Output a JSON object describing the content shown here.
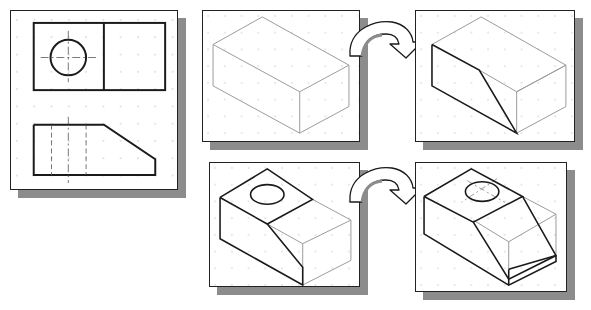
{
  "diagram": {
    "panels": [
      {
        "id": "orthographic-views",
        "label": "Top and front orthographic views with hole and angled cut"
      },
      {
        "id": "iso-base-block",
        "label": "Isometric base rectangular block"
      },
      {
        "id": "iso-angled-cut",
        "label": "Isometric block with angled cut on front face"
      },
      {
        "id": "iso-cut-with-hole",
        "label": "Isometric block with cut and circular hole on top"
      },
      {
        "id": "iso-final-part",
        "label": "Isometric final part with chamfer and hidden hole centerlines"
      }
    ],
    "arrows": [
      {
        "from": "iso-base-block",
        "to": "iso-angled-cut",
        "icon": "curved-arrow-icon"
      },
      {
        "from": "iso-cut-with-hole",
        "to": "iso-final-part",
        "icon": "curved-arrow-icon"
      }
    ],
    "colors": {
      "line_dark": "#1a1a1a",
      "line_light": "#9a9a9a",
      "grid_dot": "#b5b5b5",
      "shadow": "#8c8c8c",
      "panel_bg": "#ffffff"
    }
  }
}
